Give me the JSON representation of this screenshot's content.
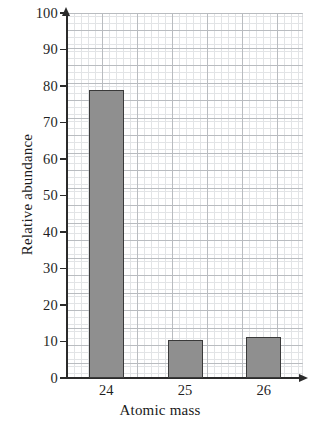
{
  "chart_data": {
    "type": "bar",
    "title": "",
    "xlabel": "Atomic mass",
    "ylabel": "Relative abundance",
    "categories": [
      "24",
      "25",
      "26"
    ],
    "values": [
      79,
      10.3,
      11.2
    ],
    "ylim": [
      0,
      100
    ],
    "yticks": [
      0,
      10,
      20,
      30,
      40,
      50,
      60,
      70,
      80,
      90,
      100
    ],
    "ytick_labels": [
      "0",
      "10",
      "20",
      "30",
      "40",
      "50",
      "60",
      "70",
      "80",
      "90",
      "100"
    ],
    "grid": true,
    "grid_style": "graph-paper",
    "legend": "none",
    "bar_fill_color": "#8f8f8f",
    "bar_border_color": "#3a3a3a",
    "axis_color": "#2b2b2b",
    "grid_major_color": "#b9bcc0",
    "grid_minor_color": "#e2e4e6",
    "background_color": "#ffffff"
  },
  "axes": {
    "y_title": "Relative abundance",
    "x_title": "Atomic mass"
  }
}
